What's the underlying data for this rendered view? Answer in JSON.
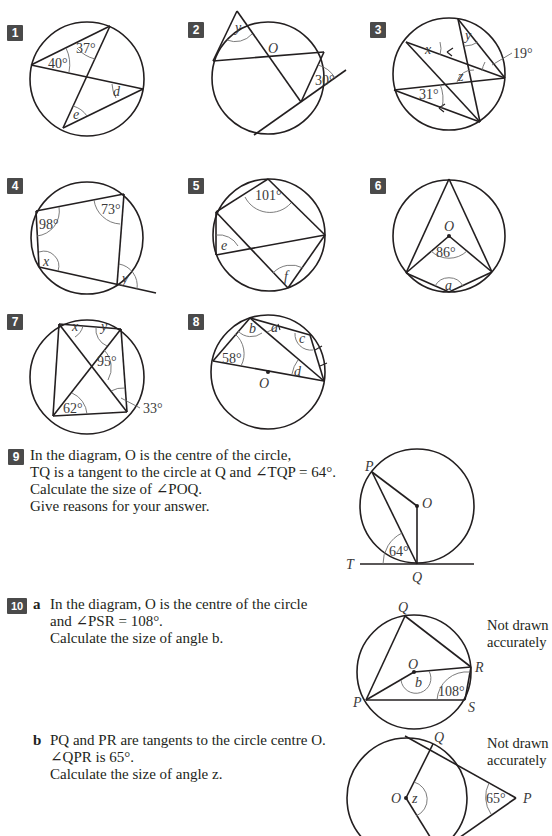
{
  "questions": [
    {
      "number": "1",
      "labels": {
        "angle1": "40°",
        "angle2": "37°",
        "var1": "d",
        "var2": "e"
      }
    },
    {
      "number": "2",
      "labels": {
        "centre": "O",
        "var1": "y",
        "angle1": "30°"
      }
    },
    {
      "number": "3",
      "labels": {
        "var1": "x",
        "var2": "y",
        "var3": "z",
        "angle1": "19°",
        "angle2": "31°"
      }
    },
    {
      "number": "4",
      "labels": {
        "angle1": "98°",
        "angle2": "73°",
        "var1": "x",
        "var2": "y"
      }
    },
    {
      "number": "5",
      "labels": {
        "angle1": "101°",
        "var1": "e",
        "var2": "f"
      }
    },
    {
      "number": "6",
      "labels": {
        "centre": "O",
        "angle1": "86°",
        "var1": "a"
      }
    },
    {
      "number": "7",
      "labels": {
        "var1": "x",
        "var2": "y",
        "angle1": "95°",
        "angle2": "62°",
        "angle3": "33°"
      }
    },
    {
      "number": "8",
      "labels": {
        "var1": "a",
        "var2": "b",
        "var3": "c",
        "var4": "d",
        "angle1": "58°",
        "centre": "O"
      }
    },
    {
      "number": "9",
      "text": [
        "In the diagram, O is the centre of the circle,",
        "TQ is a tangent to the circle at Q and ∠TQP = 64°.",
        "Calculate the size of ∠POQ.",
        "Give reasons for your answer."
      ],
      "labels": {
        "P": "P",
        "O": "O",
        "T": "T",
        "Q": "Q",
        "angle1": "64°"
      }
    },
    {
      "number": "10",
      "parts": [
        {
          "letter": "a",
          "text": [
            "In the diagram, O is the centre of the circle",
            "and ∠PSR = 108°.",
            "Calculate the size of angle b."
          ],
          "note": [
            "Not drawn",
            "accurately"
          ],
          "labels": {
            "Q": "Q",
            "O": "O",
            "R": "R",
            "P": "P",
            "S": "S",
            "var1": "b",
            "angle1": "108°"
          }
        },
        {
          "letter": "b",
          "text": [
            "PQ and PR are tangents to the circle centre O.",
            "∠QPR is 65°.",
            "Calculate the size of angle z."
          ],
          "note": [
            "Not drawn",
            "accurately"
          ],
          "labels": {
            "Q": "Q",
            "O": "O",
            "P": "P",
            "var1": "z",
            "angle1": "65°"
          }
        }
      ]
    }
  ]
}
